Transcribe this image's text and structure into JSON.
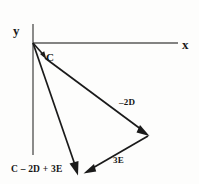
{
  "figure": {
    "kind": "vector-addition-diagram",
    "width": 199,
    "height": 184,
    "background_color": "#fdfdfc",
    "stroke_color": "#1a1a1a",
    "axis_color": "#555555"
  },
  "axes": {
    "x_label": "x",
    "y_label": "y",
    "origin": {
      "x": 33,
      "y": 43
    },
    "x_axis": {
      "x1": 33,
      "y1": 43,
      "x2": 178,
      "y2": 43
    },
    "y_axis": {
      "x1": 33,
      "y1": 24,
      "x2": 33,
      "y2": 155
    }
  },
  "vectors": [
    {
      "name": "C",
      "label": "C",
      "from": {
        "x": 33,
        "y": 43
      },
      "to": {
        "x": 46,
        "y": 59
      },
      "label_pos": {
        "x": 46,
        "y": 52
      }
    },
    {
      "name": "-2D",
      "label": "–2D",
      "from": {
        "x": 46,
        "y": 59
      },
      "to": {
        "x": 148,
        "y": 135
      },
      "label_pos": {
        "x": 119,
        "y": 98
      }
    },
    {
      "name": "3E",
      "label": "3E",
      "from": {
        "x": 148,
        "y": 135
      },
      "to": {
        "x": 85,
        "y": 172
      },
      "label_pos": {
        "x": 113,
        "y": 156
      }
    },
    {
      "name": "resultant",
      "label": "C – 2D + 3E",
      "from": {
        "x": 33,
        "y": 43
      },
      "to": {
        "x": 78,
        "y": 174
      },
      "label_pos": {
        "x": 11,
        "y": 165
      }
    }
  ]
}
